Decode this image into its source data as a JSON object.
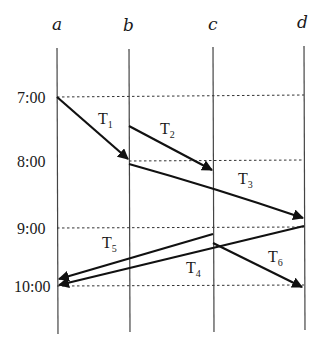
{
  "diagram": {
    "type": "space-time transaction diagram",
    "sites": [
      {
        "id": "a",
        "label": "a",
        "x": 57
      },
      {
        "id": "b",
        "label": "b",
        "x": 129
      },
      {
        "id": "c",
        "label": "c",
        "x": 213
      },
      {
        "id": "d",
        "label": "d",
        "x": 304
      }
    ],
    "times": [
      {
        "label": "7:00",
        "y": 97
      },
      {
        "label": "8:00",
        "y": 161
      },
      {
        "label": "9:00",
        "y": 228
      },
      {
        "label": "10:00",
        "y": 286
      }
    ],
    "transactions": [
      {
        "name": "T",
        "sub": "1",
        "from": "a",
        "to": "b",
        "x1": 57,
        "y1": 97,
        "x2": 129,
        "y2": 160,
        "label_x": 98,
        "label_y": 124
      },
      {
        "name": "T",
        "sub": "2",
        "from": "b",
        "to": "c",
        "x1": 129,
        "y1": 126,
        "x2": 213,
        "y2": 171,
        "label_x": 160,
        "label_y": 134
      },
      {
        "name": "T",
        "sub": "3",
        "from": "b",
        "to": "d",
        "x1": 129,
        "y1": 164,
        "x2": 304,
        "y2": 218,
        "label_x": 238,
        "label_y": 184
      },
      {
        "name": "T",
        "sub": "4",
        "from": "d",
        "to": "a",
        "x1": 304,
        "y1": 226,
        "x2": 57,
        "y2": 286,
        "label_x": 186,
        "label_y": 273
      },
      {
        "name": "T",
        "sub": "5",
        "from": "c",
        "to": "a",
        "x1": 213,
        "y1": 234,
        "x2": 57,
        "y2": 279,
        "label_x": 102,
        "label_y": 248
      },
      {
        "name": "T",
        "sub": "6",
        "from": "c",
        "to": "d",
        "x1": 213,
        "y1": 243,
        "x2": 304,
        "y2": 288,
        "label_x": 268,
        "label_y": 262
      }
    ]
  }
}
